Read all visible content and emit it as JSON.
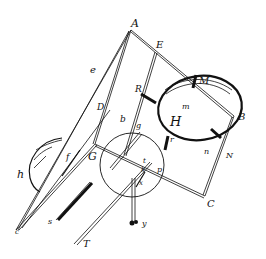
{
  "figure": {
    "type": "hand-drawn technical line illustration",
    "background": "#ffffff",
    "ink": "#111111"
  },
  "labels": {
    "A": "A",
    "E": "E",
    "M": "M",
    "B": "B",
    "R": "R",
    "m": "m",
    "H": "H",
    "r": "r",
    "n": "n",
    "N": "N",
    "C": "C",
    "p": "p",
    "D": "D",
    "b": "b",
    "g": "g",
    "t": "t",
    "k": "k",
    "x": "x",
    "y": "y",
    "G": "G",
    "e": "e",
    "h": "h",
    "f": "f",
    "c": "c",
    "s": "s",
    "T": "T"
  }
}
